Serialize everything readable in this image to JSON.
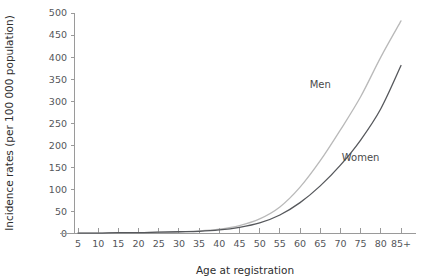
{
  "chart_data": {
    "type": "line",
    "title": "",
    "xlabel": "Age at registration",
    "ylabel": "Incidence rates (per 100 000 population)",
    "x": [
      "5",
      "10",
      "15",
      "20",
      "25",
      "30",
      "35",
      "40",
      "45",
      "50",
      "55",
      "60",
      "65",
      "70",
      "75",
      "80",
      "85+"
    ],
    "categories": [
      "5",
      "10",
      "15",
      "20",
      "25",
      "30",
      "35",
      "40",
      "45",
      "50",
      "55",
      "60",
      "65",
      "70",
      "75",
      "80",
      "85+"
    ],
    "yticks": [
      "0",
      "50",
      "100",
      "150",
      "200",
      "250",
      "300",
      "350",
      "400",
      "450",
      "500"
    ],
    "ylim": [
      0,
      500
    ],
    "grid": false,
    "legend_position": "inline-annotations",
    "series": [
      {
        "name": "Men",
        "color": "#b9b9b9",
        "label_x": "65",
        "label_value": 330,
        "values": [
          1,
          1,
          2,
          2,
          3,
          4,
          6,
          10,
          18,
          33,
          60,
          105,
          165,
          235,
          310,
          400,
          482
        ]
      },
      {
        "name": "Women",
        "color": "#56585c",
        "label_x": "75",
        "label_value": 165,
        "values": [
          1,
          1,
          2,
          2,
          3,
          4,
          5,
          8,
          14,
          24,
          42,
          70,
          108,
          155,
          212,
          283,
          381
        ]
      }
    ],
    "axis_color": "#9a9a9a",
    "text_color": "#3a3a3a"
  }
}
